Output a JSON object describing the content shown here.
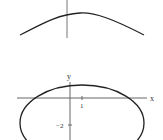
{
  "figures": [
    {
      "id": "top",
      "type": "curve",
      "description": "Concave-down arch crossing a vertical axis"
    },
    {
      "id": "bottom",
      "type": "ellipse",
      "axes": {
        "x_label": "x",
        "y_label": "y"
      },
      "ticks": {
        "x_tick": "1",
        "y_tick": "−2"
      }
    }
  ],
  "colors": {
    "stroke": "#222222",
    "axis": "#666666",
    "background": "#ffffff"
  }
}
